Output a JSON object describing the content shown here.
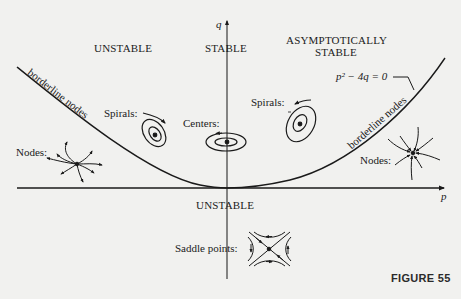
{
  "regions": {
    "unstable_top_left": "UNSTABLE",
    "stable_center": "STABLE",
    "asymptotically_stable_line1": "ASYMPTOTICALLY",
    "asymptotically_stable_line2": "STABLE",
    "unstable_bottom": "UNSTABLE"
  },
  "axes": {
    "vertical_label": "q",
    "horizontal_label": "p"
  },
  "curve": {
    "equation": "p² − 4q = 0",
    "left_branch_label": "borderline nodes",
    "right_branch_label": "borderline nodes"
  },
  "portraits": {
    "nodes_left": "Nodes:",
    "spirals_left": "Spirals:",
    "centers": "Centers:",
    "spirals_right": "Spirals:",
    "nodes_right": "Nodes:",
    "saddle_points": "Saddle points:"
  },
  "caption": "FIGURE 55",
  "colors": {
    "background": "#f1f1ef",
    "ink": "#1a1a1a"
  }
}
